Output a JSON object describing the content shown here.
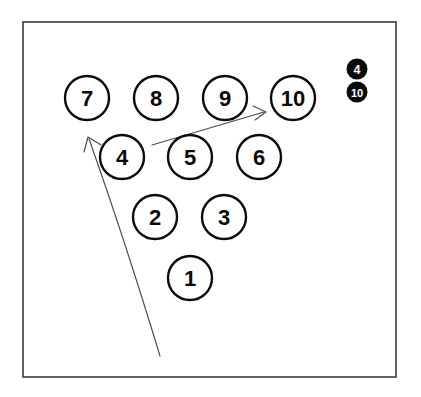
{
  "figure": {
    "background_color": "#ffffff",
    "frame": {
      "name": "outer-frame",
      "x": 23,
      "y": 22,
      "width": 373,
      "height": 355,
      "stroke_color": "#3a3a3a"
    }
  },
  "pins": [
    {
      "id": "pin-7",
      "label": "7",
      "cx": 87,
      "cy": 98,
      "r": 22,
      "row": 1
    },
    {
      "id": "pin-8",
      "label": "8",
      "cx": 156,
      "cy": 98,
      "r": 22,
      "row": 1
    },
    {
      "id": "pin-9",
      "label": "9",
      "cx": 225,
      "cy": 98,
      "r": 22,
      "row": 1
    },
    {
      "id": "pin-10",
      "label": "10",
      "cx": 293,
      "cy": 98,
      "r": 22,
      "row": 1
    },
    {
      "id": "pin-4",
      "label": "4",
      "cx": 122,
      "cy": 157,
      "r": 22,
      "row": 2
    },
    {
      "id": "pin-5",
      "label": "5",
      "cx": 190,
      "cy": 157,
      "r": 22,
      "row": 2
    },
    {
      "id": "pin-6",
      "label": "6",
      "cx": 259,
      "cy": 157,
      "r": 22,
      "row": 2
    },
    {
      "id": "pin-2",
      "label": "2",
      "cx": 155,
      "cy": 217,
      "r": 22,
      "row": 3
    },
    {
      "id": "pin-3",
      "label": "3",
      "cx": 224,
      "cy": 217,
      "r": 22,
      "row": 3
    },
    {
      "id": "pin-1",
      "label": "1",
      "cx": 190,
      "cy": 278,
      "r": 22,
      "row": 4
    }
  ],
  "arrows": [
    {
      "id": "arrow-to-pin-10",
      "name": "arrow-to-pin-10",
      "description": "straight arrow pointing up-right toward pin 10",
      "path": "M 152 145 L 264 112",
      "head": "M 253 106 L 266 112 L 255 120",
      "stroke_color": "#4a4a4a"
    },
    {
      "id": "arrow-to-pin-4",
      "name": "arrow-to-pin-4",
      "description": "long curved arrow sweeping up-left toward pin 4",
      "path": "M 160 356 C 143 300 116 215 89 139",
      "head": "M 84 152 L 88 137 L 101 145",
      "stroke_color": "#4a4a4a"
    }
  ],
  "legend": {
    "name": "pin-legend",
    "position": "top-right",
    "items": [
      {
        "id": "legend-4",
        "label": "4",
        "cx": 357,
        "cy": 69,
        "r": 10.5,
        "fill": "#0a0a0a",
        "text_color": "#ffffff"
      },
      {
        "id": "legend-10",
        "label": "10",
        "cx": 357,
        "cy": 92,
        "r": 10.5,
        "fill": "#0a0a0a",
        "text_color": "#ffffff"
      }
    ]
  },
  "chart_data": {
    "type": "scatter",
    "xlabel": "",
    "ylabel": "",
    "categories": [
      "1",
      "2",
      "3",
      "4",
      "5",
      "6",
      "7",
      "8",
      "9",
      "10"
    ],
    "points": [
      {
        "label": "7",
        "x": 87,
        "y": 98
      },
      {
        "label": "8",
        "x": 156,
        "y": 98
      },
      {
        "label": "9",
        "x": 225,
        "y": 98
      },
      {
        "label": "10",
        "x": 293,
        "y": 98
      },
      {
        "label": "4",
        "x": 122,
        "y": 157
      },
      {
        "label": "5",
        "x": 190,
        "y": 157
      },
      {
        "label": "6",
        "x": 259,
        "y": 157
      },
      {
        "label": "2",
        "x": 155,
        "y": 217
      },
      {
        "label": "3",
        "x": 224,
        "y": 217
      },
      {
        "label": "1",
        "x": 190,
        "y": 278
      }
    ],
    "annotations": [
      "4",
      "10"
    ],
    "legend_entries": [
      "4",
      "10"
    ],
    "legend_position": "top-right",
    "grid": false
  }
}
